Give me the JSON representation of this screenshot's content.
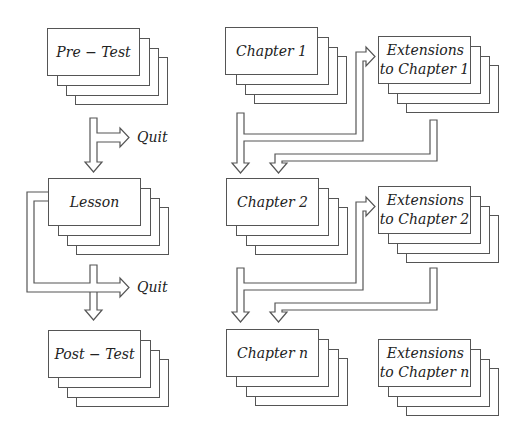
{
  "diagram": {
    "left_column": {
      "pre_test": {
        "label": "Pre − Test"
      },
      "lesson": {
        "label": "Lesson"
      },
      "post_test": {
        "label": "Post − Test"
      },
      "quit_1": {
        "label": "Quit"
      },
      "quit_2": {
        "label": "Quit"
      }
    },
    "right_column": {
      "chapters": [
        {
          "label": "Chapter 1",
          "extension_line1": "Extensions",
          "extension_line2": "to Chapter 1"
        },
        {
          "label": "Chapter 2",
          "extension_line1": "Extensions",
          "extension_line2": "to Chapter 2"
        },
        {
          "label": "Chapter n",
          "extension_line1": "Extensions",
          "extension_line2": "to Chapter n"
        }
      ]
    },
    "colors": {
      "line": "#555555",
      "text": "#222222",
      "background": "#ffffff"
    }
  }
}
